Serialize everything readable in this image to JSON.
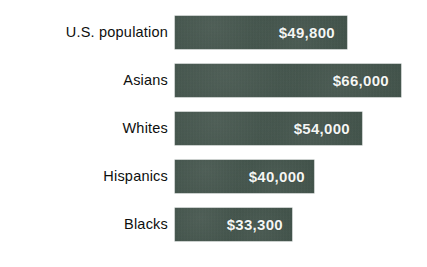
{
  "chart_data": {
    "type": "bar",
    "orientation": "horizontal",
    "title": "",
    "subtitle": "",
    "xlabel": "",
    "ylabel": "",
    "grid": false,
    "legend": null,
    "axis_visible": false,
    "value_prefix": "$",
    "xlim": [
      0,
      66000
    ],
    "categories": [
      "U.S. population",
      "Asians",
      "Whites",
      "Hispanics",
      "Blacks"
    ],
    "values": [
      49800,
      66000,
      54000,
      40000,
      33300
    ],
    "value_labels": [
      "$49,800",
      "$66,000",
      "$54,000",
      "$40,000",
      "$33,300"
    ],
    "bar_pixel_widths": [
      172,
      226,
      187,
      139,
      117
    ],
    "series": [
      {
        "name": "Median household income",
        "values": [
          49800,
          66000,
          54000,
          40000,
          33300
        ]
      }
    ],
    "colors": {
      "bar": "#405249",
      "value_text": "#f4f6f4",
      "category_text": "#0e0f0e",
      "background": "#ffffff"
    }
  },
  "rows": [
    {
      "label": "U.S. population",
      "value_label": "$49,800",
      "width": 172
    },
    {
      "label": "Asians",
      "value_label": "$66,000",
      "width": 226
    },
    {
      "label": "Whites",
      "value_label": "$54,000",
      "width": 187
    },
    {
      "label": "Hispanics",
      "value_label": "$40,000",
      "width": 139
    },
    {
      "label": "Blacks",
      "value_label": "$33,300",
      "width": 117
    }
  ]
}
